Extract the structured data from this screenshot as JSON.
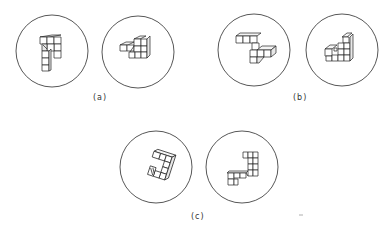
{
  "figure": {
    "panels": [
      {
        "id": "a",
        "label": "(a)",
        "views": [
          {
            "name": "a-left",
            "cx": 52,
            "cy": 51,
            "r": 36,
            "object": "block figure of stacked cubes, L/7 shape, viewed from front-top"
          },
          {
            "name": "a-right",
            "cx": 138,
            "cy": 52,
            "r": 36,
            "object": "same block figure rotated, viewed obliquely"
          }
        ]
      },
      {
        "id": "b",
        "label": "(b)",
        "views": [
          {
            "name": "b-left",
            "cx": 254,
            "cy": 50,
            "r": 36,
            "object": "Z-shaped block figure of cubes"
          },
          {
            "name": "b-right",
            "cx": 342,
            "cy": 50,
            "r": 36,
            "object": "triangular staircase block figure"
          }
        ]
      },
      {
        "id": "c",
        "label": "(c)",
        "views": [
          {
            "name": "c-left",
            "cx": 156,
            "cy": 167,
            "r": 36,
            "object": "hook-shaped block figure of cubes, rotated"
          },
          {
            "name": "c-right",
            "cx": 242,
            "cy": 167,
            "r": 36,
            "object": "J-shaped block figure of cubes"
          }
        ]
      }
    ]
  }
}
